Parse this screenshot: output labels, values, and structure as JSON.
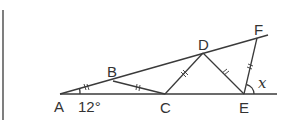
{
  "diagram": {
    "points": {
      "A": {
        "label": "A",
        "x": 60,
        "y": 94
      },
      "B": {
        "label": "B",
        "x": 113,
        "y": 81
      },
      "C": {
        "label": "C",
        "x": 165,
        "y": 94
      },
      "D": {
        "label": "D",
        "x": 203,
        "y": 53
      },
      "E": {
        "label": "E",
        "x": 244,
        "y": 94
      },
      "F": {
        "label": "F",
        "x": 257,
        "y": 38
      }
    },
    "angle_A_label": "12°",
    "angle_x_label": "x",
    "equal_segments": [
      "AB",
      "BC",
      "CD",
      "DE",
      "EF"
    ],
    "line_color": "#3a3a3a"
  }
}
